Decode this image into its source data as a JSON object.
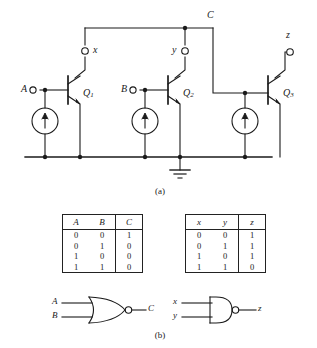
{
  "figure": {
    "top_fragment": "",
    "caption_a": "(a)",
    "caption_b": "(b)"
  },
  "circuit": {
    "inputs": [
      {
        "name": "A",
        "label": "A"
      },
      {
        "name": "B",
        "label": "B"
      }
    ],
    "nodes": [
      {
        "name": "x",
        "label": "x"
      },
      {
        "name": "y",
        "label": "y"
      },
      {
        "name": "C",
        "label": "C"
      }
    ],
    "output": {
      "name": "z",
      "label": "z"
    },
    "transistors": [
      {
        "name": "Q1",
        "label": "Q",
        "subscript": "1"
      },
      {
        "name": "Q2",
        "label": "Q",
        "subscript": "2"
      },
      {
        "name": "Q3",
        "label": "Q",
        "subscript": "3"
      }
    ],
    "current_sources": 3,
    "ground_symbol": "earth-ground",
    "line_color": "#1a1a1a"
  },
  "truth_tables": [
    {
      "name": "nor-table",
      "headers": [
        "A",
        "B",
        "C"
      ],
      "rows": [
        [
          "0",
          "0",
          "1"
        ],
        [
          "0",
          "1",
          "0"
        ],
        [
          "1",
          "0",
          "0"
        ],
        [
          "1",
          "1",
          "0"
        ]
      ]
    },
    {
      "name": "nand-table",
      "headers": [
        "x",
        "y",
        "z"
      ],
      "rows": [
        [
          "0",
          "0",
          "1"
        ],
        [
          "0",
          "1",
          "1"
        ],
        [
          "1",
          "0",
          "1"
        ],
        [
          "1",
          "1",
          "0"
        ]
      ]
    }
  ],
  "gates": [
    {
      "name": "nor-gate",
      "type": "NOR",
      "inputs": [
        "A",
        "B"
      ],
      "output": "C"
    },
    {
      "name": "nand-gate",
      "type": "NAND",
      "inputs": [
        "x",
        "y"
      ],
      "output": "z"
    }
  ]
}
